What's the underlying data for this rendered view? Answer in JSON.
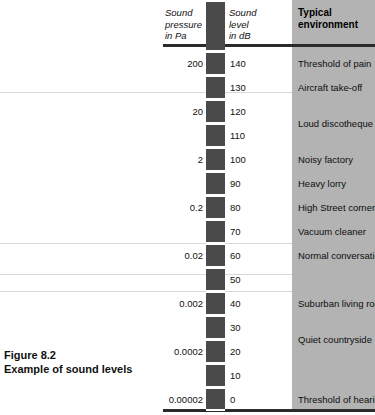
{
  "figure": {
    "caption_title": "Figure 8.2",
    "caption_subtitle": "Example of sound levels"
  },
  "table": {
    "headers": {
      "pressure": "Sound\npressure\nin Pa",
      "pressure_line1": "Sound",
      "pressure_line2": "pressure",
      "pressure_line3": "in Pa",
      "level_line1": "Sound",
      "level_line2": "level",
      "level_line3": "in dB",
      "environment_line1": "Typical",
      "environment_line2": "environment"
    },
    "colors": {
      "scale_bar": "#4a4a4a",
      "environment_column": "#b3b3b3",
      "rule": "#2b2b2b",
      "page_rule": "#d8d8d8"
    }
  },
  "chart_data": {
    "type": "table",
    "title": "Example of sound levels",
    "columns": [
      "Sound pressure in Pa",
      "Sound level in dB",
      "Typical environment"
    ],
    "db_ticks": [
      140,
      130,
      120,
      110,
      100,
      90,
      80,
      70,
      60,
      50,
      40,
      30,
      20,
      10,
      0
    ],
    "pressure_pa": {
      "140": "200",
      "120": "20",
      "100": "2",
      "80": "0.2",
      "60": "0.02",
      "40": "0.002",
      "20": "0.0002",
      "0": "0.00002"
    },
    "environments": [
      {
        "db": 140,
        "label": "Threshold of pain"
      },
      {
        "db": 130,
        "label": "Aircraft take-off"
      },
      {
        "db": 115,
        "label": "Loud discotheque"
      },
      {
        "db": 100,
        "label": "Noisy factory"
      },
      {
        "db": 90,
        "label": "Heavy lorry"
      },
      {
        "db": 80,
        "label": "High Street corner"
      },
      {
        "db": 70,
        "label": "Vacuum cleaner"
      },
      {
        "db": 60,
        "label": "Normal conversation"
      },
      {
        "db": 40,
        "label": "Suburban living room"
      },
      {
        "db": 25,
        "label": "Quiet countryside"
      },
      {
        "db": 0,
        "label": "Threshold of hearing"
      }
    ],
    "ylabel": "Sound level in dB",
    "ylim": [
      0,
      140
    ],
    "grid": false,
    "legend": "none"
  }
}
